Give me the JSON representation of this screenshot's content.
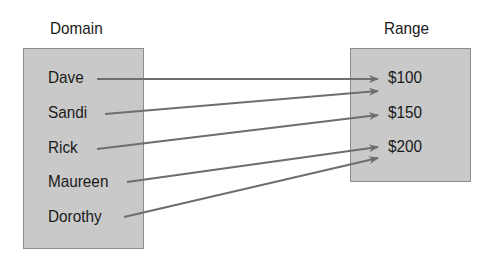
{
  "domain": {
    "title": "Domain",
    "items": [
      "Dave",
      "Sandi",
      "Rick",
      "Maureen",
      "Dorothy"
    ]
  },
  "range": {
    "title": "Range",
    "items": [
      "$100",
      "$150",
      "$200"
    ]
  },
  "mappings": [
    {
      "from": "Dave",
      "to": "$100"
    },
    {
      "from": "Sandi",
      "to": "$100"
    },
    {
      "from": "Rick",
      "to": "$150"
    },
    {
      "from": "Maureen",
      "to": "$200"
    },
    {
      "from": "Dorothy",
      "to": "$200"
    }
  ],
  "colors": {
    "box_fill": "#c9c9c9",
    "box_border": "#8c8c8c",
    "arrow": "#6e6e6e"
  }
}
